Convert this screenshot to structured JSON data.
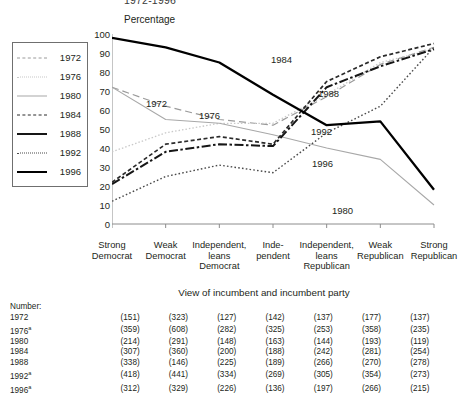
{
  "clipped_title": "1972-1996",
  "yaxis_title": "Percentage",
  "xaxis_caption": "View of incumbent and incumbent party",
  "legend": {
    "items": [
      {
        "label": "1972",
        "style": "dashed",
        "color": "#9a9a9a"
      },
      {
        "label": "1976",
        "style": "dotted",
        "color": "#c8c8c8"
      },
      {
        "label": "1980",
        "style": "solid",
        "color": "#a8a8a8"
      },
      {
        "label": "1984",
        "style": "dashed",
        "color": "#2b2b2b"
      },
      {
        "label": "1988",
        "style": "solid-dash",
        "color": "#161616"
      },
      {
        "label": "1992",
        "style": "dotted",
        "color": "#4a4a4a"
      },
      {
        "label": "1996",
        "style": "solid",
        "color": "#000000"
      }
    ]
  },
  "annotations": [
    {
      "label": "1972",
      "x": 146,
      "y": 98
    },
    {
      "label": "1976",
      "x": 199,
      "y": 110
    },
    {
      "label": "1984",
      "x": 271,
      "y": 54
    },
    {
      "label": "1988",
      "x": 318,
      "y": 88
    },
    {
      "label": "1992",
      "x": 311,
      "y": 126
    },
    {
      "label": "1996",
      "x": 312,
      "y": 158
    },
    {
      "label": "1980",
      "x": 332,
      "y": 205
    }
  ],
  "chart_data": {
    "type": "line",
    "title": "1972-1996",
    "xlabel": "View of incumbent and incumbent party",
    "ylabel": "Percentage",
    "ylim": [
      0,
      100
    ],
    "ytick_step": 10,
    "grid": false,
    "legend_position": "left-outside",
    "categories": [
      "Strong Democrat",
      "Weak Democrat",
      "Independent, leans Democrat",
      "Independent",
      "Independent, leans Republican",
      "Weak Republican",
      "Strong Republican"
    ],
    "yticks": [
      0,
      10,
      20,
      30,
      40,
      50,
      60,
      70,
      80,
      90,
      100
    ],
    "series": [
      {
        "name": "1972",
        "values": [
          72,
          62,
          55,
          52,
          67,
          84,
          93
        ]
      },
      {
        "name": "1976",
        "values": [
          38,
          48,
          53,
          53,
          68,
          85,
          92
        ]
      },
      {
        "name": "1980",
        "values": [
          72,
          55,
          53,
          47,
          40,
          34,
          10
        ]
      },
      {
        "name": "1984",
        "values": [
          22,
          42,
          46,
          42,
          75,
          88,
          95
        ]
      },
      {
        "name": "1988",
        "values": [
          21,
          38,
          42,
          41,
          72,
          83,
          92
        ]
      },
      {
        "name": "1992",
        "values": [
          12,
          25,
          31,
          27,
          48,
          62,
          93
        ]
      },
      {
        "name": "1996",
        "values": [
          98,
          93,
          85,
          68,
          52,
          54,
          18
        ]
      }
    ]
  },
  "number_table": {
    "header": "Number:",
    "rows": [
      {
        "year": "1972",
        "note": "",
        "counts": [
          "(151)",
          "(323)",
          "(127)",
          "(142)",
          "(137)",
          "(177)",
          "(137)"
        ]
      },
      {
        "year": "1976",
        "note": "a",
        "counts": [
          "(359)",
          "(608)",
          "(282)",
          "(325)",
          "(253)",
          "(358)",
          "(235)"
        ]
      },
      {
        "year": "1980",
        "note": "",
        "counts": [
          "(214)",
          "(291)",
          "(148)",
          "(163)",
          "(144)",
          "(193)",
          "(119)"
        ]
      },
      {
        "year": "1984",
        "note": "",
        "counts": [
          "(307)",
          "(360)",
          "(200)",
          "(188)",
          "(242)",
          "(281)",
          "(254)"
        ]
      },
      {
        "year": "1988",
        "note": "",
        "counts": [
          "(338)",
          "(146)",
          "(225)",
          "(189)",
          "(266)",
          "(270)",
          "(278)"
        ]
      },
      {
        "year": "1992",
        "note": "a",
        "counts": [
          "(418)",
          "(441)",
          "(334)",
          "(269)",
          "(305)",
          "(354)",
          "(273)"
        ]
      },
      {
        "year": "1996",
        "note": "a",
        "counts": [
          "(312)",
          "(329)",
          "(226)",
          "(136)",
          "(197)",
          "(266)",
          "(215)"
        ]
      }
    ]
  }
}
